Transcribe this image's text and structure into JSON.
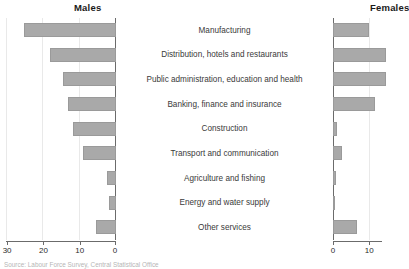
{
  "panels": {
    "males_title": "Males",
    "females_title": "Females"
  },
  "source_note": "Source: Labour Force Survey, Central Statistical Office",
  "axis": {
    "males_ticks": [
      "30",
      "20",
      "10",
      "0"
    ],
    "females_ticks": [
      "0",
      "10"
    ]
  },
  "chart_data": {
    "type": "bar",
    "orientation": "horizontal",
    "layout": "back-to-back (pyramid) bar chart, two panels sharing centred category labels",
    "categories": [
      "Manufacturing",
      "Distribution, hotels and restaurants",
      "Public administration, education and health",
      "Banking, finance and insurance",
      "Construction",
      "Transport and communication",
      "Agriculture and fishing",
      "Energy and water supply",
      "Other services"
    ],
    "series": [
      {
        "name": "Males",
        "panel": "left",
        "direction": "right-to-left",
        "values": [
          25.3,
          18.2,
          14.6,
          13.2,
          11.8,
          9.1,
          2.5,
          1.8,
          5.5
        ]
      },
      {
        "name": "Females",
        "panel": "right",
        "direction": "left-to-right",
        "values": [
          10.0,
          14.5,
          14.5,
          11.5,
          1.2,
          2.5,
          0.8,
          0.5,
          6.5
        ]
      }
    ],
    "xlabel": "",
    "ylabel": "",
    "males_xlim": [
      30,
      0
    ],
    "females_xlim": [
      0,
      14
    ],
    "males_tick_values": [
      30,
      20,
      10,
      0
    ],
    "females_tick_values": [
      0,
      10
    ],
    "grid": true,
    "legend": "none",
    "bar_color": "#a9a9a9",
    "note": "Females panel is cropped at the right edge of the image; longest female bars run past the visible area."
  }
}
